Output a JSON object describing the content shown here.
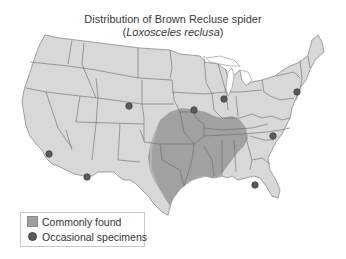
{
  "title": {
    "line1": "Distribution of Brown Recluse spider",
    "line2_open": "(",
    "line2_species": "Loxosceles reclusa",
    "line2_close": ")"
  },
  "colors": {
    "land": "#d8d8d8",
    "border": "#6a6a6a",
    "range": "#9e9e9e",
    "range_light": "#bdbdbd",
    "specimen_dot": "#5a5a5a",
    "water": "#ffffff"
  },
  "map": {
    "region": "Contiguous United States",
    "range_label": "Commonly found",
    "range_states": [
      "Missouri",
      "Arkansas",
      "Oklahoma",
      "Kansas (southeast)",
      "Texas (central/east)",
      "Louisiana",
      "Mississippi",
      "Alabama",
      "Tennessee",
      "Kentucky",
      "Illinois (south)",
      "Indiana (south)",
      "Georgia (northwest)",
      "Nebraska (southeast)",
      "Iowa (south)"
    ],
    "occasional_specimens": [
      {
        "label": "California (Los Angeles area)"
      },
      {
        "label": "Arizona (southern)"
      },
      {
        "label": "Colorado (Denver area)"
      },
      {
        "label": "Iowa (central)"
      },
      {
        "label": "Illinois (Chicago area)"
      },
      {
        "label": "New Jersey / New York area"
      },
      {
        "label": "North Carolina"
      },
      {
        "label": "Florida (Tallahassee area)"
      }
    ]
  },
  "legend": {
    "items": [
      {
        "label": "Commonly found",
        "symbol": "square-swatch"
      },
      {
        "label": "Occasional specimens",
        "symbol": "circle-dot"
      }
    ]
  }
}
